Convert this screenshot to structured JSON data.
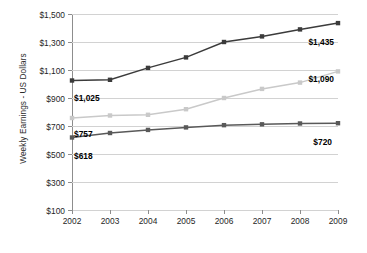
{
  "chart_data": {
    "type": "line",
    "title": "",
    "xlabel": "",
    "ylabel": "Weekly Earnings - US Dollars",
    "categories": [
      "2002",
      "2003",
      "2004",
      "2005",
      "2006",
      "2007",
      "2008",
      "2009"
    ],
    "x": [
      2002,
      2003,
      2004,
      2005,
      2006,
      2007,
      2008,
      2009
    ],
    "ylim": [
      100,
      1500
    ],
    "yticks": [
      100,
      300,
      500,
      700,
      900,
      1100,
      1300,
      1500
    ],
    "ytick_labels": [
      "$100",
      "$300",
      "$500",
      "$700",
      "$900",
      "$1,100",
      "$1,300",
      "$1,500"
    ],
    "grid": true,
    "legend": "none",
    "series": [
      {
        "name": "upper-line",
        "color": "#3b3b3b",
        "values": [
          1025,
          1030,
          1115,
          1190,
          1300,
          1340,
          1390,
          1435
        ]
      },
      {
        "name": "middle-line",
        "color": "#c9c9c9",
        "values": [
          757,
          775,
          780,
          820,
          900,
          965,
          1010,
          1090
        ]
      },
      {
        "name": "lower-line",
        "color": "#595959",
        "values": [
          618,
          650,
          672,
          690,
          706,
          712,
          718,
          720
        ]
      }
    ],
    "annotations": [
      {
        "text": "$1,025",
        "series": "upper-line",
        "x_index": 0,
        "value": 1025,
        "dx": 2,
        "dy": 12
      },
      {
        "text": "$1,435",
        "series": "upper-line",
        "x_index": 7,
        "value": 1435,
        "dx": -4,
        "dy": 14
      },
      {
        "text": "$1,090",
        "series": "middle-line",
        "x_index": 7,
        "value": 1090,
        "dx": -4,
        "dy": 3
      },
      {
        "text": "$757",
        "series": "middle-line",
        "x_index": 0,
        "value": 757,
        "dx": 2,
        "dy": 11
      },
      {
        "text": "$618",
        "series": "lower-line",
        "x_index": 0,
        "value": 618,
        "dx": 2,
        "dy": 14
      },
      {
        "text": "$720",
        "series": "lower-line",
        "x_index": 7,
        "value": 720,
        "dx": -6,
        "dy": 14
      }
    ]
  },
  "axis": {
    "y_title": "Weekly Earnings - US Dollars"
  }
}
